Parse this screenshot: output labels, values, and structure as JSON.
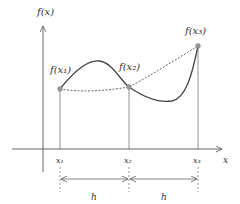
{
  "diagram": {
    "axes": {
      "y_label": "f(x)",
      "x_label": "x"
    },
    "points": [
      {
        "label": "f(x₁)",
        "x_label": "x₁",
        "x": 60,
        "y": 89
      },
      {
        "label": "f(x₂)",
        "x_label": "x₂",
        "x": 129,
        "y": 87
      },
      {
        "label": "f(x₃)",
        "x_label": "x₃",
        "x": 198,
        "y": 46
      }
    ],
    "intervals": [
      {
        "label": "h"
      },
      {
        "label": "h"
      }
    ],
    "colors": {
      "curve": "#444444",
      "axis": "#555555",
      "point": "#999999",
      "dashed": "#555555"
    }
  }
}
